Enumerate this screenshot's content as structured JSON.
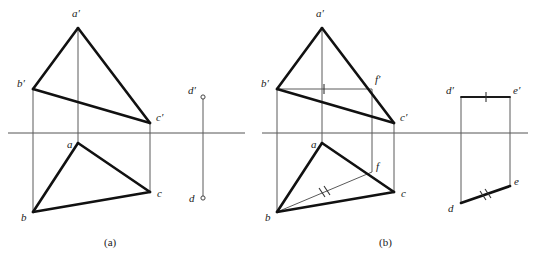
{
  "figure": {
    "captions": [
      {
        "id": "caption-a",
        "text": "(a)",
        "x": 110,
        "y": 243
      },
      {
        "id": "caption-b",
        "text": "(b)",
        "x": 385,
        "y": 243
      }
    ],
    "colors": {
      "thick_stroke": "#111111",
      "thin_stroke": "#5a5a5a",
      "axis_stroke": "#555555",
      "background": "#ffffff"
    }
  },
  "panel_a": {
    "name": "panel-a",
    "axis": {
      "x1": 8,
      "y1": 133,
      "x2": 245,
      "y2": 133
    },
    "vertices": {
      "a_prime": {
        "label": "a′",
        "x": 78,
        "y": 28,
        "lx": 72,
        "ly": 17
      },
      "b_prime": {
        "label": "b′",
        "x": 33,
        "y": 89,
        "lx": 19,
        "ly": 87
      },
      "c_prime": {
        "label": "c′",
        "x": 150,
        "y": 123,
        "lx": 157,
        "ly": 121
      },
      "a": {
        "label": "a",
        "x": 78,
        "y": 143,
        "lx": 68,
        "ly": 146
      },
      "b": {
        "label": "b",
        "x": 33,
        "y": 212,
        "lx": 22,
        "ly": 219
      },
      "c": {
        "label": "c",
        "x": 150,
        "y": 192,
        "lx": 157,
        "ly": 196
      },
      "d_prime": {
        "label": "d′",
        "x": 203,
        "y": 97,
        "lx": 190,
        "ly": 95
      },
      "d": {
        "label": "d",
        "x": 203,
        "y": 198,
        "lx": 190,
        "ly": 200
      }
    },
    "thick_paths": [
      {
        "name": "edge-a-prime-b-prime",
        "d": "M78,28 L33,89"
      },
      {
        "name": "edge-a-prime-c-prime",
        "d": "M78,28 L150,123"
      },
      {
        "name": "edge-b-prime-c-prime",
        "d": "M33,89 L150,123"
      },
      {
        "name": "edge-a-b",
        "d": "M78,143 L33,212"
      },
      {
        "name": "edge-a-c",
        "d": "M78,143 L150,192"
      },
      {
        "name": "edge-b-c",
        "d": "M33,212 L150,192"
      }
    ],
    "thin_paths": [
      {
        "name": "projector-a",
        "d": "M78,28 L78,143"
      },
      {
        "name": "projector-b",
        "d": "M33,89 L33,212"
      },
      {
        "name": "projector-c",
        "d": "M150,123 L150,192"
      },
      {
        "name": "projector-d",
        "d": "M203,97 L203,198"
      }
    ]
  },
  "panel_b": {
    "name": "panel-b",
    "axis": {
      "x1": 262,
      "y1": 133,
      "x2": 528,
      "y2": 133
    },
    "vertices": {
      "a_prime": {
        "label": "a′",
        "x": 322,
        "y": 28,
        "lx": 316,
        "ly": 17
      },
      "b_prime": {
        "label": "b′",
        "x": 277,
        "y": 89,
        "lx": 263,
        "ly": 87
      },
      "c_prime": {
        "label": "c′",
        "x": 394,
        "y": 123,
        "lx": 401,
        "ly": 121
      },
      "f_prime": {
        "label": "f′",
        "x": 372,
        "y": 89,
        "lx": 375,
        "ly": 82
      },
      "a": {
        "label": "a",
        "x": 322,
        "y": 143,
        "lx": 312,
        "ly": 146
      },
      "b": {
        "label": "b",
        "x": 277,
        "y": 212,
        "lx": 266,
        "ly": 219
      },
      "c": {
        "label": "c",
        "x": 394,
        "y": 192,
        "lx": 401,
        "ly": 196
      },
      "f": {
        "label": "f",
        "x": 372,
        "y": 172,
        "lx": 376,
        "ly": 169
      },
      "d_prime": {
        "label": "d′",
        "x": 461,
        "y": 97,
        "lx": 447,
        "ly": 95
      },
      "e_prime": {
        "label": "e′",
        "x": 510,
        "y": 97,
        "lx": 514,
        "ly": 95
      },
      "d": {
        "label": "d",
        "x": 461,
        "y": 203,
        "lx": 449,
        "ly": 210
      },
      "e": {
        "label": "e",
        "x": 510,
        "y": 186,
        "lx": 515,
        "ly": 184
      }
    },
    "thick_paths": [
      {
        "name": "edge-a-prime-b-prime",
        "d": "M322,28 L277,89"
      },
      {
        "name": "edge-a-prime-c-prime",
        "d": "M322,28 L394,123"
      },
      {
        "name": "edge-b-prime-c-prime",
        "d": "M277,89 L394,123"
      },
      {
        "name": "edge-a-b",
        "d": "M322,143 L277,212"
      },
      {
        "name": "edge-a-c",
        "d": "M322,143 L394,192"
      },
      {
        "name": "edge-b-c",
        "d": "M277,212 L394,192"
      },
      {
        "name": "edge-d-e",
        "d": "M461,203 L510,186"
      }
    ],
    "medium_paths": [
      {
        "name": "edge-d-prime-e-prime",
        "d": "M461,97 L510,97"
      }
    ],
    "thin_paths": [
      {
        "name": "projector-a",
        "d": "M322,28 L322,143"
      },
      {
        "name": "projector-b",
        "d": "M277,89 L277,212"
      },
      {
        "name": "projector-c",
        "d": "M394,123 L394,192"
      },
      {
        "name": "auxiliary-b-prime-f-prime",
        "d": "M277,89 L372,89"
      },
      {
        "name": "projector-f",
        "d": "M372,89 L372,172"
      },
      {
        "name": "auxiliary-b-f",
        "d": "M277,212 L372,172"
      },
      {
        "name": "projector-d",
        "d": "M461,97 L461,203"
      },
      {
        "name": "projector-e",
        "d": "M510,97 L510,186"
      }
    ],
    "tick_marks": [
      {
        "name": "tick-b-prime-f-prime",
        "cx": 324,
        "cy": 89,
        "angle": 0
      },
      {
        "name": "tick-b-f-double-a",
        "cx": 322,
        "cy": 192,
        "angle": -23
      },
      {
        "name": "tick-b-f-double-b",
        "cx": 327,
        "cy": 190,
        "angle": -23
      },
      {
        "name": "tick-d-prime-e-prime",
        "cx": 486,
        "cy": 97,
        "angle": 0
      },
      {
        "name": "tick-d-e-double-a",
        "cx": 483,
        "cy": 195,
        "angle": -19
      },
      {
        "name": "tick-d-e-double-b",
        "cx": 488,
        "cy": 193,
        "angle": -19
      }
    ]
  },
  "geometry_data": {
    "type": "engineering-drawing",
    "description": "Two-view orthographic projection problem: triangle ABC given by frontal projection a'b'c' and horizontal projection abc, plus a line segment DE. Panel (a) shows the given data; panel (b) shows the construction with auxiliary point F used to find the intersection.",
    "panel_a_label": "(a)",
    "panel_b_label": "(b)",
    "points": [
      "a",
      "b",
      "c",
      "d",
      "e",
      "f"
    ],
    "primed_points": [
      "a′",
      "b′",
      "c′",
      "d′",
      "e′",
      "f′"
    ]
  }
}
